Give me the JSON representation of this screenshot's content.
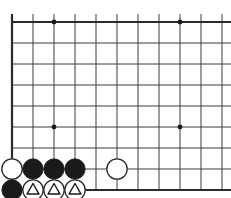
{
  "figure": {
    "name": "go-board-corner-diagram",
    "type": "go-board-diagram",
    "width": 231,
    "height": 198,
    "background_color": "#ffffff",
    "line_color": "#3c3c3c",
    "edge_line_color": "#2b2b2b",
    "black_stone_color": "#1a1a1a",
    "white_stone_color": "#ffffff",
    "white_stone_outline_color": "#2b2b2b",
    "mark_color": "#1a1a1a"
  },
  "geometry": {
    "spacing": 21,
    "origin_x": 12,
    "origin_y": 22,
    "columns": 11,
    "rows": 9,
    "left_edge_x": 12,
    "top_edge_y": 22,
    "bottom_edge_y": 190,
    "right_clip_x": 231,
    "thin_line_width": 1,
    "edge_line_width": 2.2,
    "stone_radius": 10.2
  },
  "star_points": [
    {
      "name": "star-point-top-left",
      "col": 2,
      "row": 0
    },
    {
      "name": "star-point-top-right",
      "col": 8,
      "row": 0
    },
    {
      "name": "star-point-bottom-left",
      "col": 2,
      "row": 5
    },
    {
      "name": "star-point-bottom-right",
      "col": 8,
      "row": 5
    }
  ],
  "stones": [
    {
      "name": "white-stone-c2",
      "color": "white",
      "col": 0,
      "row": 7,
      "mark": "none"
    },
    {
      "name": "black-stone-d2",
      "color": "black",
      "col": 1,
      "row": 7,
      "mark": "none"
    },
    {
      "name": "black-stone-e2",
      "color": "black",
      "col": 2,
      "row": 7,
      "mark": "none"
    },
    {
      "name": "black-stone-f2",
      "color": "black",
      "col": 3,
      "row": 7,
      "mark": "none"
    },
    {
      "name": "white-stone-i2",
      "color": "white",
      "col": 5,
      "row": 7,
      "mark": "none"
    },
    {
      "name": "black-stone-c1",
      "color": "black",
      "col": 0,
      "row": 8,
      "mark": "none"
    },
    {
      "name": "white-stone-d1-triangle",
      "color": "white",
      "col": 1,
      "row": 8,
      "mark": "triangle"
    },
    {
      "name": "white-stone-e1-triangle",
      "color": "white",
      "col": 2,
      "row": 8,
      "mark": "triangle"
    },
    {
      "name": "white-stone-f1-triangle",
      "color": "white",
      "col": 3,
      "row": 8,
      "mark": "triangle"
    }
  ]
}
